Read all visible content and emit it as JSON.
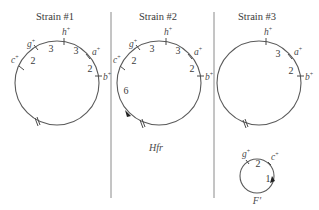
{
  "panels": [
    {
      "title": "Strain #1",
      "genes": [
        {
          "name": "c",
          "sup": "+"
        },
        {
          "name": "g",
          "sup": "+"
        },
        {
          "name": "h",
          "sup": "+"
        },
        {
          "name": "a",
          "sup": "+"
        },
        {
          "name": "b",
          "sup": "+"
        }
      ],
      "distances": [
        "2",
        "3",
        "3",
        "2"
      ],
      "caption": ""
    },
    {
      "title": "Strain #2",
      "genes": [
        {
          "name": "c",
          "sup": "+"
        },
        {
          "name": "g",
          "sup": "+"
        },
        {
          "name": "h",
          "sup": "+"
        },
        {
          "name": "a",
          "sup": "+"
        },
        {
          "name": "b",
          "sup": "+"
        }
      ],
      "distances": [
        "2",
        "3",
        "3",
        "2",
        "6"
      ],
      "caption": "Hfr"
    },
    {
      "title": "Strain #3",
      "genes": [
        {
          "name": "h",
          "sup": "+"
        },
        {
          "name": "a",
          "sup": "+"
        },
        {
          "name": "b",
          "sup": "+"
        }
      ],
      "distances": [
        "3",
        "2"
      ],
      "caption": "",
      "episome": {
        "genes": [
          {
            "name": "g",
            "sup": "+"
          },
          {
            "name": "c",
            "sup": "+"
          }
        ],
        "distances": [
          "2",
          "1"
        ],
        "caption": "F′"
      }
    }
  ],
  "colors": {
    "ring": "#5a5a5a",
    "text": "#3a3a3a",
    "divider": "#8a8a8a"
  }
}
